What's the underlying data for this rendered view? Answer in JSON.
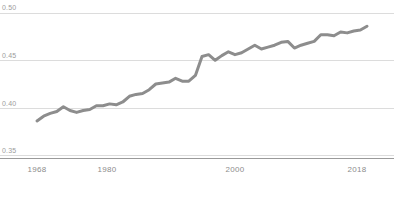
{
  "chart_data": {
    "type": "line",
    "title": "",
    "subtitle": "",
    "xlabel": "",
    "ylabel": "",
    "xlim": [
      1968,
      2018
    ],
    "ylim": [
      0.35,
      0.5
    ],
    "grid": true,
    "legend": null,
    "legend_position": "none",
    "line_color": "#8d8d8d",
    "gridline_color": "#dcdcdc",
    "axis_color": "#9a9a9a",
    "tick_label_color": "#94949a",
    "y_ticks": [
      "0.50",
      "0.45",
      "0.40",
      "0.35"
    ],
    "y_tick_values": [
      0.5,
      0.45,
      0.4,
      0.35
    ],
    "x_ticks": [
      "1968",
      "1980",
      "2000",
      "2018"
    ],
    "x_tick_values": [
      1968,
      1980,
      2000,
      2018
    ],
    "series": [
      {
        "name": "",
        "x": [
          1968,
          1969,
          1970,
          1971,
          1972,
          1973,
          1974,
          1975,
          1976,
          1977,
          1978,
          1979,
          1980,
          1981,
          1982,
          1983,
          1984,
          1985,
          1986,
          1987,
          1988,
          1989,
          1990,
          1991,
          1992,
          1993,
          1994,
          1995,
          1996,
          1997,
          1998,
          1999,
          2000,
          2001,
          2002,
          2003,
          2004,
          2005,
          2006,
          2007,
          2008,
          2009,
          2010,
          2011,
          2012,
          2013,
          2014,
          2015,
          2016,
          2017,
          2018
        ],
        "values": [
          0.386,
          0.391,
          0.394,
          0.396,
          0.401,
          0.397,
          0.395,
          0.397,
          0.398,
          0.402,
          0.402,
          0.404,
          0.403,
          0.406,
          0.412,
          0.414,
          0.415,
          0.419,
          0.425,
          0.426,
          0.427,
          0.431,
          0.428,
          0.428,
          0.434,
          0.454,
          0.456,
          0.45,
          0.455,
          0.459,
          0.456,
          0.458,
          0.462,
          0.466,
          0.462,
          0.464,
          0.466,
          0.469,
          0.47,
          0.463,
          0.466,
          0.468,
          0.47,
          0.477,
          0.477,
          0.476,
          0.48,
          0.479,
          0.481,
          0.482,
          0.486
        ]
      }
    ]
  }
}
